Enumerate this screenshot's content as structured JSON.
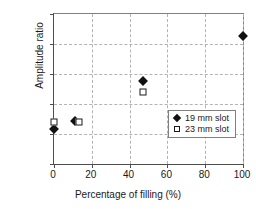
{
  "chart_data": {
    "type": "scatter",
    "title": "",
    "xlabel": "Percentage of filling (%)",
    "ylabel": "Amplitude ratio",
    "xlim": [
      0,
      100
    ],
    "ylim": [
      0.0,
      0.5
    ],
    "xticks": [
      "0",
      "20",
      "40",
      "60",
      "80",
      "100"
    ],
    "xtick_values": [
      0,
      20,
      40,
      60,
      80,
      100
    ],
    "yticks": [
      "0.00",
      "0.10",
      "0.20",
      "0.30",
      "0.40",
      "0.50"
    ],
    "ytick_values": [
      0.0,
      0.1,
      0.2,
      0.3,
      0.4,
      0.5
    ],
    "grid": true,
    "legend_position": "lower right",
    "series": [
      {
        "name": "19 mm slot",
        "marker": "filled-diamond",
        "color": "#111111",
        "points": [
          {
            "x": 0,
            "y": 0.117
          },
          {
            "x": 11,
            "y": 0.142
          },
          {
            "x": 47,
            "y": 0.278
          },
          {
            "x": 100,
            "y": 0.428
          }
        ]
      },
      {
        "name": "23 mm slot",
        "marker": "open-square",
        "color": "#ffffff",
        "points": [
          {
            "x": 0,
            "y": 0.14
          },
          {
            "x": 13,
            "y": 0.14
          },
          {
            "x": 47,
            "y": 0.24
          }
        ]
      }
    ]
  },
  "legend": {
    "entries": [
      {
        "label": "19 mm slot",
        "marker": "filled-diamond"
      },
      {
        "label": "23 mm slot",
        "marker": "open-square"
      }
    ]
  }
}
